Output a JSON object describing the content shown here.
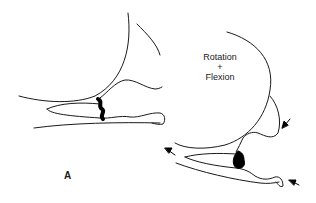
{
  "diagram": {
    "panel_label": "A",
    "annotation": {
      "line1": "Rotation",
      "line2": "+",
      "line3": "Flexion"
    },
    "colors": {
      "stroke": "#1a1a1a",
      "fill": "#000000",
      "background": "#ffffff"
    }
  }
}
